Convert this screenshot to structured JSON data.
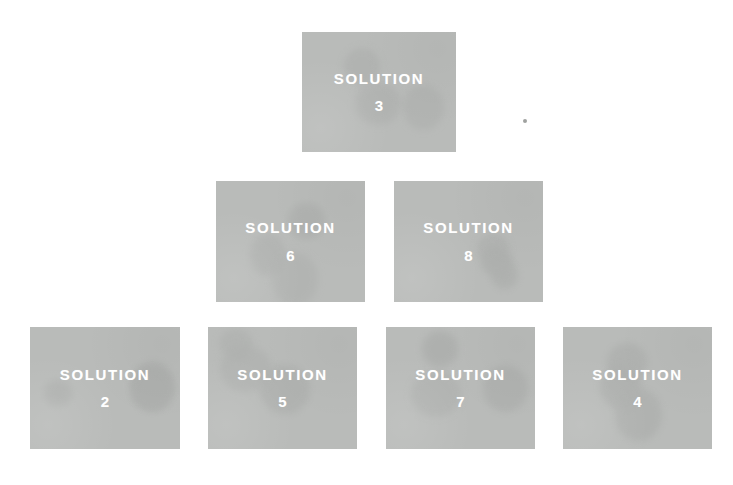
{
  "diagram": {
    "type": "pyramid-hierarchy",
    "background_color": "#ffffff",
    "card_color": "#b9bbb9",
    "card_text_color": "#ffffff",
    "rows": [
      {
        "level": 1,
        "cards": [
          {
            "title": "SOLUTION",
            "number": "3",
            "x": 302,
            "y": 32,
            "width": 154,
            "height": 120
          }
        ]
      },
      {
        "level": 2,
        "cards": [
          {
            "title": "SOLUTION",
            "number": "6",
            "x": 216,
            "y": 181,
            "width": 149,
            "height": 121
          },
          {
            "title": "SOLUTION",
            "number": "8",
            "x": 394,
            "y": 181,
            "width": 149,
            "height": 121
          }
        ]
      },
      {
        "level": 3,
        "cards": [
          {
            "title": "SOLUTION",
            "number": "2",
            "x": 30,
            "y": 327,
            "width": 150,
            "height": 122
          },
          {
            "title": "SOLUTION",
            "number": "5",
            "x": 208,
            "y": 327,
            "width": 149,
            "height": 122
          },
          {
            "title": "SOLUTION",
            "number": "7",
            "x": 386,
            "y": 327,
            "width": 149,
            "height": 122
          },
          {
            "title": "SOLUTION",
            "number": "4",
            "x": 563,
            "y": 327,
            "width": 149,
            "height": 122
          }
        ]
      }
    ],
    "artifact": {
      "name": "scan-speck",
      "x": 523,
      "y": 119
    }
  }
}
